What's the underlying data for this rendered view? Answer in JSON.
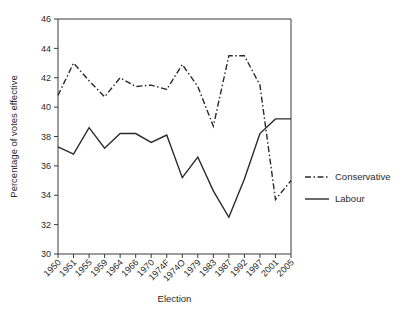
{
  "chart_data": {
    "type": "line",
    "title": "",
    "xlabel": "Election",
    "ylabel": "Percentage of votes effective",
    "categories": [
      "1950",
      "1951",
      "1955",
      "1959",
      "1964",
      "1966",
      "1970",
      "1974F",
      "1974O",
      "1979",
      "1983",
      "1987",
      "1992",
      "1997",
      "2001",
      "2005"
    ],
    "ylim": [
      30,
      46
    ],
    "yticks": [
      30,
      32,
      34,
      36,
      38,
      40,
      42,
      44,
      46
    ],
    "ytick_labels": [
      "30",
      "32",
      "34",
      "36",
      "38",
      "40",
      "42",
      "44",
      "46"
    ],
    "grid": false,
    "legend_position": "right",
    "series": [
      {
        "name": "Conservative",
        "style": "dash-dot",
        "color": "#2a2a2a",
        "values": [
          40.8,
          43.0,
          41.8,
          40.7,
          42.0,
          41.4,
          41.5,
          41.2,
          42.9,
          41.4,
          38.7,
          43.5,
          43.5,
          41.5,
          33.7,
          35.0
        ]
      },
      {
        "name": "Labour",
        "style": "solid",
        "color": "#2a2a2a",
        "values": [
          37.3,
          36.8,
          38.6,
          37.2,
          38.2,
          38.2,
          37.6,
          38.1,
          35.2,
          36.6,
          34.3,
          32.5,
          35.1,
          38.2,
          39.2,
          39.2
        ]
      }
    ]
  },
  "legend": {
    "items": [
      {
        "label": "Conservative",
        "style": "dash-dot"
      },
      {
        "label": "Labour",
        "style": "solid"
      }
    ]
  },
  "axes": {
    "x_title": "Election",
    "y_title": "Percentage of votes effective"
  }
}
